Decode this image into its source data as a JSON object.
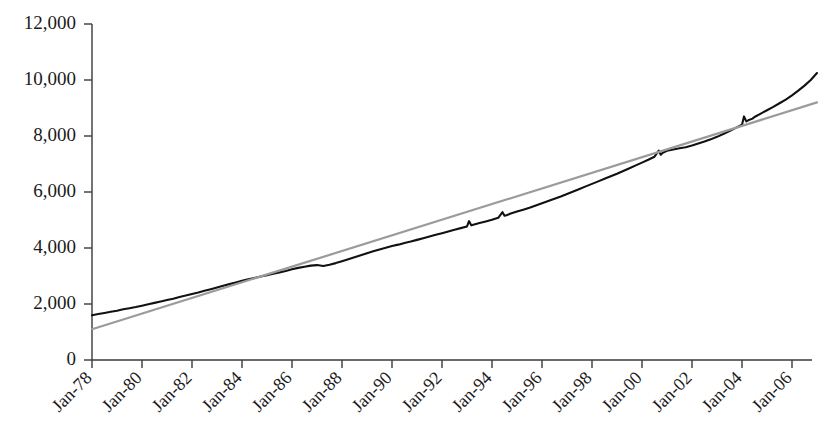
{
  "chart_data": {
    "type": "line",
    "title": "",
    "subtitle": "",
    "xlabel": "",
    "ylabel": "",
    "grid": false,
    "legend": "none",
    "xlim": [
      "Jan-78",
      "Jan-07"
    ],
    "ylim": [
      0,
      12000
    ],
    "y_ticks": [
      0,
      2000,
      4000,
      6000,
      8000,
      10000,
      12000
    ],
    "y_tick_labels": [
      "0",
      "2,000",
      "4,000",
      "6,000",
      "8,000",
      "10,000",
      "12,000"
    ],
    "x_tick_labels": [
      "Jan-78",
      "Jan-80",
      "Jan-82",
      "Jan-84",
      "Jan-86",
      "Jan-88",
      "Jan-90",
      "Jan-92",
      "Jan-94",
      "Jan-96",
      "Jan-98",
      "Jan-00",
      "Jan-02",
      "Jan-04",
      "Jan-06"
    ],
    "x_tick_values": [
      1978,
      1980,
      1982,
      1984,
      1986,
      1988,
      1990,
      1992,
      1994,
      1996,
      1998,
      2000,
      2002,
      2004,
      2006
    ],
    "series": [
      {
        "name": "data",
        "color": "#111111",
        "style": "solid",
        "x": [
          1978.0,
          1978.25,
          1978.5,
          1978.75,
          1979.0,
          1979.25,
          1979.5,
          1979.75,
          1980.0,
          1980.25,
          1980.5,
          1980.75,
          1981.0,
          1981.25,
          1981.5,
          1981.75,
          1982.0,
          1982.25,
          1982.5,
          1982.75,
          1983.0,
          1983.25,
          1983.5,
          1983.75,
          1984.0,
          1984.25,
          1984.5,
          1984.75,
          1985.0,
          1985.25,
          1985.5,
          1985.75,
          1986.0,
          1986.25,
          1986.5,
          1986.75,
          1987.0,
          1987.25,
          1987.5,
          1987.75,
          1988.0,
          1988.25,
          1988.5,
          1988.75,
          1989.0,
          1989.25,
          1989.5,
          1989.75,
          1990.0,
          1990.25,
          1990.5,
          1990.75,
          1991.0,
          1991.25,
          1991.5,
          1991.75,
          1992.0,
          1992.25,
          1992.5,
          1992.75,
          1993.0,
          1993.08,
          1993.17,
          1993.25,
          1993.5,
          1993.75,
          1994.0,
          1994.25,
          1994.42,
          1994.5,
          1994.58,
          1994.75,
          1995.0,
          1995.25,
          1995.5,
          1995.75,
          1996.0,
          1996.25,
          1996.5,
          1996.75,
          1997.0,
          1997.25,
          1997.5,
          1997.75,
          1998.0,
          1998.25,
          1998.5,
          1998.75,
          1999.0,
          1999.25,
          1999.5,
          1999.75,
          2000.0,
          2000.25,
          2000.5,
          2000.67,
          2000.75,
          2000.83,
          2001.0,
          2001.25,
          2001.5,
          2001.75,
          2002.0,
          2002.25,
          2002.5,
          2002.75,
          2003.0,
          2003.25,
          2003.5,
          2003.75,
          2004.0,
          2004.08,
          2004.17,
          2004.25,
          2004.42,
          2004.5,
          2004.75,
          2005.0,
          2005.25,
          2005.5,
          2005.75,
          2006.0,
          2006.25,
          2006.5,
          2006.75,
          2007.0
        ],
        "values": [
          1600,
          1640,
          1680,
          1720,
          1760,
          1810,
          1850,
          1890,
          1940,
          1990,
          2040,
          2090,
          2140,
          2190,
          2250,
          2300,
          2360,
          2410,
          2470,
          2530,
          2590,
          2650,
          2710,
          2770,
          2830,
          2880,
          2930,
          2980,
          3030,
          3080,
          3130,
          3180,
          3240,
          3290,
          3330,
          3370,
          3390,
          3360,
          3400,
          3460,
          3530,
          3600,
          3670,
          3740,
          3810,
          3880,
          3950,
          4010,
          4070,
          4120,
          4180,
          4230,
          4290,
          4350,
          4410,
          4470,
          4530,
          4590,
          4650,
          4710,
          4770,
          4960,
          4810,
          4830,
          4890,
          4950,
          5010,
          5080,
          5280,
          5150,
          5170,
          5230,
          5300,
          5370,
          5440,
          5520,
          5600,
          5680,
          5760,
          5840,
          5930,
          6020,
          6110,
          6200,
          6290,
          6380,
          6470,
          6560,
          6650,
          6750,
          6850,
          6950,
          7050,
          7150,
          7260,
          7480,
          7330,
          7400,
          7470,
          7520,
          7560,
          7600,
          7660,
          7730,
          7800,
          7880,
          7970,
          8070,
          8180,
          8290,
          8400,
          8700,
          8520,
          8560,
          8620,
          8680,
          8800,
          8920,
          9040,
          9170,
          9300,
          9450,
          9620,
          9800,
          10000,
          10250
        ]
      },
      {
        "name": "trend",
        "color": "#9b9b9b",
        "style": "solid",
        "x": [
          1978.0,
          2007.0
        ],
        "values": [
          1100,
          9200
        ]
      }
    ]
  }
}
